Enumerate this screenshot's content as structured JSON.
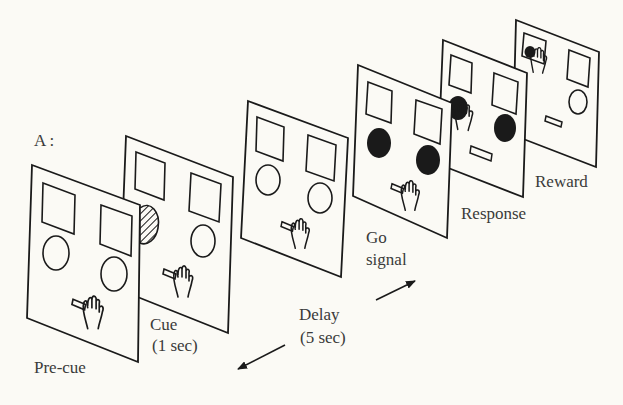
{
  "figure": {
    "panel_label": "A :",
    "background": "#fbfaf5",
    "ink": "#1a1a1a"
  },
  "panels": [
    {
      "id": "pre-cue",
      "label": "Pre-cue",
      "state": "all stimuli outlined, hand on holding lever"
    },
    {
      "id": "cue",
      "label": "Cue",
      "sublabel": "(1 sec)",
      "state": "left circle hatched (cue), hand on lever"
    },
    {
      "id": "delay",
      "label": "Delay",
      "sublabel": "(5 sec)",
      "state": "all stimuli outlined, hand on lever"
    },
    {
      "id": "go-signal",
      "label": "Go",
      "sublabel": "signal",
      "state": "both circles filled black, hand on lever"
    },
    {
      "id": "response",
      "label": "Response",
      "state": "hand presses left filled circle, lever released"
    },
    {
      "id": "reward",
      "label": "Reward",
      "state": "hand on upper-left square target with filled dot"
    }
  ],
  "arrows": [
    {
      "id": "arrow-back",
      "direction": "toward earlier (lower-left)"
    },
    {
      "id": "arrow-forward",
      "direction": "toward later (upper-right)"
    }
  ]
}
